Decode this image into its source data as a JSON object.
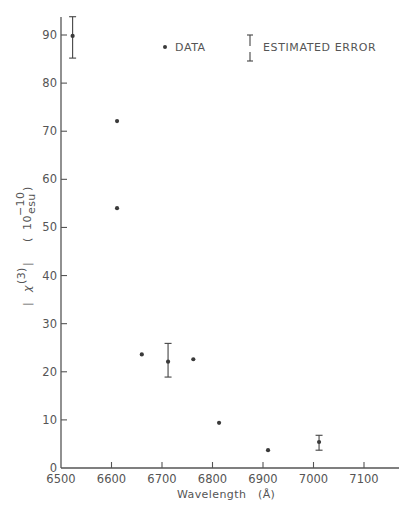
{
  "chart_data": {
    "type": "scatter",
    "title": "",
    "xlabel": "Wavelength",
    "xlabel_unit": "(Å)",
    "ylabel": "| χ(3) |",
    "ylabel_unit": "( 10^-10 esu )",
    "ylabel_parts": {
      "chi_left": "|",
      "chi": "χ",
      "chi_sup": "(3)",
      "chi_right": "|",
      "unit_open": "(",
      "unit_base": "10",
      "unit_exp": "−10",
      "unit_name": "esu",
      "unit_close": ")"
    },
    "xlim": [
      6500,
      7180
    ],
    "ylim": [
      0,
      94
    ],
    "x_ticks": [
      6500,
      6600,
      6700,
      6800,
      6900,
      7000,
      7100
    ],
    "x_tick_labels": [
      "6500",
      "6600",
      "6700",
      "6800",
      "6900",
      "7000",
      "7100"
    ],
    "y_ticks": [
      0,
      10,
      20,
      30,
      40,
      50,
      60,
      70,
      80,
      90
    ],
    "y_tick_labels": [
      "0",
      "10",
      "20",
      "30",
      "40",
      "50",
      "60",
      "70",
      "80",
      "90"
    ],
    "grid": false,
    "legend": {
      "position": "top-right",
      "entries": [
        {
          "marker": "dot",
          "label": "DATA"
        },
        {
          "marker": "errorbar",
          "label": "ESTIMATED ERROR"
        }
      ]
    },
    "series": [
      {
        "name": "DATA",
        "points": [
          {
            "x": 6523,
            "y": 89.8,
            "err_low": 85.2,
            "err_high": 93.8
          },
          {
            "x": 6611,
            "y": 72.1
          },
          {
            "x": 6611,
            "y": 54.0
          },
          {
            "x": 6660,
            "y": 23.6
          },
          {
            "x": 6712,
            "y": 22.1,
            "err_low": 18.9,
            "err_high": 25.9
          },
          {
            "x": 6762,
            "y": 22.6
          },
          {
            "x": 6813,
            "y": 9.4
          },
          {
            "x": 6910,
            "y": 3.7
          },
          {
            "x": 7011,
            "y": 5.4,
            "err_low": 3.7,
            "err_high": 6.8
          }
        ]
      }
    ]
  },
  "colors": {
    "axis": "#555555",
    "marker": "#3a3a3a",
    "text": "#555555",
    "background": "#ffffff"
  }
}
